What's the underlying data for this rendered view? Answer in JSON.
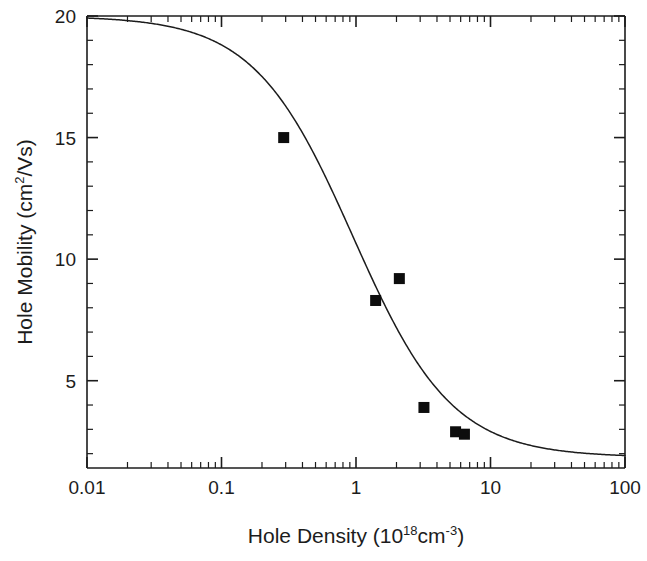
{
  "chart_data": {
    "type": "scatter",
    "title": "",
    "xlabel": "Hole Density (10²18²cm²-3²)",
    "xlabel_parts": {
      "base1": "Hole Density (10",
      "sup1": "18",
      "base2": "cm",
      "sup2": "-3",
      "base3": ")"
    },
    "ylabel_parts": {
      "base1": "Hole Mobility (cm",
      "sup1": "2",
      "base2": "/Vs)"
    },
    "ylabel": "Hole Mobility (cm2/Vs)",
    "xscale": "log",
    "yscale": "linear",
    "xlim": [
      0.01,
      100
    ],
    "ylim": [
      1.41,
      20
    ],
    "grid": false,
    "legend": null,
    "xticks": [
      0.01,
      0.1,
      1,
      10,
      100
    ],
    "xtick_labels": [
      "0.01",
      "0.1",
      "1",
      "10",
      "100"
    ],
    "yticks": [
      5,
      10,
      15,
      20
    ],
    "ytick_labels": [
      "5",
      "10",
      "15",
      "20"
    ],
    "yticks_minor": [
      2,
      3,
      4,
      6,
      7,
      8,
      9,
      11,
      12,
      13,
      14,
      16,
      17,
      18,
      19
    ],
    "series": [
      {
        "name": "measured",
        "type": "scatter",
        "marker": "square",
        "marker_color": "#0d0d0d",
        "points": [
          {
            "x": 0.29,
            "y": 15.0
          },
          {
            "x": 1.4,
            "y": 8.3
          },
          {
            "x": 2.1,
            "y": 9.2
          },
          {
            "x": 3.2,
            "y": 3.9
          },
          {
            "x": 5.5,
            "y": 2.9
          },
          {
            "x": 6.4,
            "y": 2.8
          }
        ]
      },
      {
        "name": "model fit",
        "type": "line",
        "line_color": "#1c1c1c",
        "description": "Sigmoidal decay from 20 cm2/Vs plateau at low density to ~1.9 cm2/Vs plateau at high density, midpoint near 1e18 cm-3",
        "model": {
          "y_low": 20.0,
          "y_high": 1.85,
          "x_mid": 0.95,
          "slope": 1.18
        }
      }
    ]
  },
  "axes": {
    "x_label_full": "Hole Density (10 18cm -3)",
    "y_label_full": "Hole Mobility (cm 2/Vs)"
  }
}
